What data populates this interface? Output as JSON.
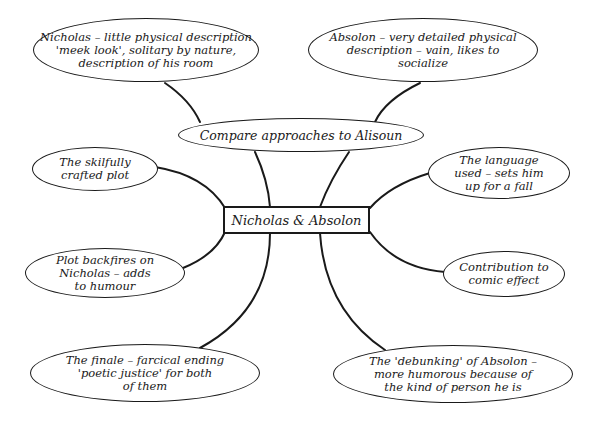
{
  "diagram": {
    "type": "mind-map",
    "center": {
      "label": "Nicholas & Absolon"
    },
    "hub": {
      "label": "Compare approaches to Alisoun"
    },
    "nodes": [
      {
        "id": "nicholas-description",
        "label": "Nicholas – little physical description\n'meek look', solitary by nature,\ndescription of his room"
      },
      {
        "id": "absolon-description",
        "label": "Absolon – very detailed physical\ndescription – vain, likes to\nsocialize"
      },
      {
        "id": "skilfully-crafted-plot",
        "label": "The skilfully\ncrafted plot"
      },
      {
        "id": "language-used",
        "label": "The language\nused – sets him\nup for a fall"
      },
      {
        "id": "plot-backfires",
        "label": "Plot backfires on\nNicholas – adds\nto humour"
      },
      {
        "id": "comic-effect",
        "label": "Contribution to\ncomic effect"
      },
      {
        "id": "finale",
        "label": "The finale – farcical ending\n'poetic justice' for both\nof them"
      },
      {
        "id": "debunking-absolon",
        "label": "The 'debunking' of Absolon –\nmore humorous because of\nthe kind of person he is"
      }
    ],
    "colors": {
      "ink": "#1a1a1a",
      "background": "#ffffff"
    }
  }
}
